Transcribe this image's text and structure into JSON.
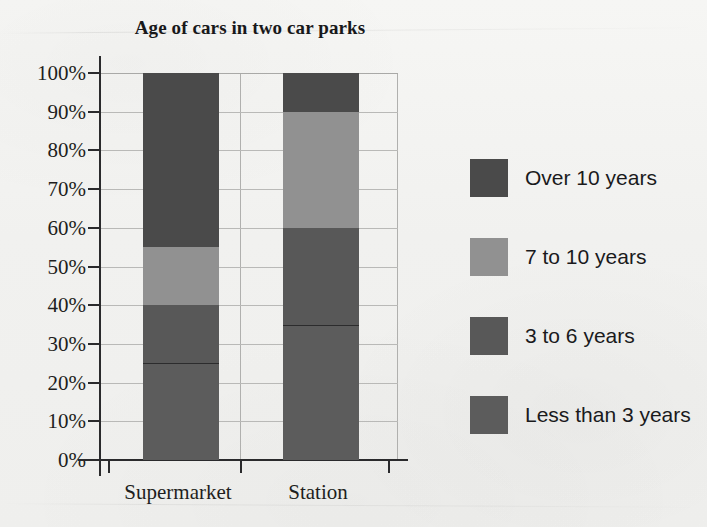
{
  "chart_data": {
    "type": "bar",
    "subtype": "stacked-percentage",
    "title": "Age of cars in two car parks",
    "xlabel": "",
    "ylabel": "",
    "ylim": [
      0,
      100
    ],
    "yticks": [
      "0%",
      "10%",
      "20%",
      "30%",
      "40%",
      "50%",
      "60%",
      "70%",
      "80%",
      "90%",
      "100%"
    ],
    "ytick_values": [
      0,
      10,
      20,
      30,
      40,
      50,
      60,
      70,
      80,
      90,
      100
    ],
    "grid": true,
    "grid_axis": "y",
    "legend_position": "right",
    "categories": [
      "Supermarket",
      "Station"
    ],
    "series": [
      {
        "name": "Less than 3 years",
        "values": [
          25,
          35
        ],
        "color": "#5a5a5a"
      },
      {
        "name": "3 to 6 years",
        "values": [
          15,
          25
        ],
        "color": "#5a5a5a"
      },
      {
        "name": "7 to 10 years",
        "values": [
          15,
          30
        ],
        "color": "#919191"
      },
      {
        "name": "Over 10 years",
        "values": [
          45,
          10
        ],
        "color": "#4a4a4a"
      }
    ],
    "stack_boundaries": {
      "Supermarket": [
        0,
        25,
        40,
        55,
        100
      ],
      "Station": [
        0,
        35,
        60,
        90,
        100
      ]
    }
  },
  "axes": {
    "y_ticks": [
      {
        "label": "100%",
        "value": 100
      },
      {
        "label": "90%",
        "value": 90
      },
      {
        "label": "80%",
        "value": 80
      },
      {
        "label": "70%",
        "value": 70
      },
      {
        "label": "60%",
        "value": 60
      },
      {
        "label": "50%",
        "value": 50
      },
      {
        "label": "40%",
        "value": 40
      },
      {
        "label": "30%",
        "value": 30
      },
      {
        "label": "20%",
        "value": 20
      },
      {
        "label": "10%",
        "value": 10
      },
      {
        "label": "0%",
        "value": 0
      }
    ],
    "x_labels": [
      {
        "label": "Supermarket",
        "center": 178
      },
      {
        "label": "Station",
        "center": 318
      }
    ]
  },
  "bars": [
    {
      "category": "Supermarket",
      "left": 143,
      "segments": [
        {
          "name": "Over 10 years",
          "from": 55,
          "to": 100,
          "color": "#4a4a4a",
          "divider": false
        },
        {
          "name": "7 to 10 years",
          "from": 40,
          "to": 55,
          "color": "#919191",
          "divider": false
        },
        {
          "name": "3 to 6 years",
          "from": 25,
          "to": 40,
          "color": "#585858",
          "divider": false
        },
        {
          "name": "Less than 3 years",
          "from": 0,
          "to": 25,
          "color": "#5c5c5c",
          "divider": true
        }
      ]
    },
    {
      "category": "Station",
      "left": 283,
      "segments": [
        {
          "name": "Over 10 years",
          "from": 90,
          "to": 100,
          "color": "#4a4a4a",
          "divider": false
        },
        {
          "name": "7 to 10 years",
          "from": 60,
          "to": 90,
          "color": "#919191",
          "divider": false
        },
        {
          "name": "3 to 6 years",
          "from": 35,
          "to": 60,
          "color": "#585858",
          "divider": false
        },
        {
          "name": "Less than 3 years",
          "from": 0,
          "to": 35,
          "color": "#5c5c5c",
          "divider": true
        }
      ]
    }
  ],
  "legend": {
    "items": [
      {
        "label": "Over 10 years",
        "color": "#4a4a4a"
      },
      {
        "label": "7 to 10 years",
        "color": "#919191"
      },
      {
        "label": "3 to 6 years",
        "color": "#585858"
      },
      {
        "label": "Less than 3 years",
        "color": "#5c5c5c"
      }
    ]
  },
  "colors": {
    "background": "#f3f3f1",
    "axis": "#2a2a2c",
    "grid": "#b9b9b7",
    "text": "#1e1e20"
  }
}
